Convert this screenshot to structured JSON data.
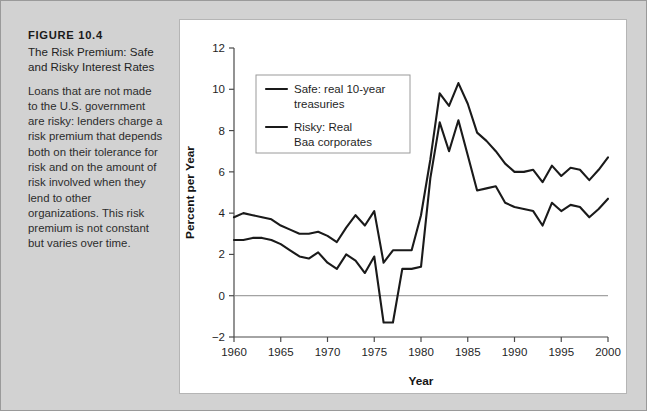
{
  "figure": {
    "label": "FIGURE 10.4",
    "title": "The Risk Premium: Safe and Risky Interest Rates",
    "description": "Loans that are not made to the U.S. government are risky: lenders charge a risk premium that depends both on their tolerance for risk and on the amount of risk involved when they lend to other organizations. This risk premium is not constant but varies over time."
  },
  "colors": {
    "page_background": "#d2d2d2",
    "panel_background": "#ffffff",
    "series_line": "#1a1a1a",
    "axis": "#4a4a4a",
    "zero_line": "#8c8c8c",
    "legend_border": "#9a9a9a"
  },
  "chart_data": {
    "type": "line",
    "title": "",
    "xlabel": "Year",
    "ylabel": "Percent per Year",
    "xlim": [
      1960,
      2000
    ],
    "ylim": [
      -2,
      12
    ],
    "xticks": [
      1960,
      1965,
      1970,
      1975,
      1980,
      1985,
      1990,
      1995,
      2000
    ],
    "yticks": [
      -2,
      0,
      2,
      4,
      6,
      8,
      10,
      12
    ],
    "grid": false,
    "zero_line": true,
    "legend_position": "upper-left-inside",
    "x": [
      1960,
      1961,
      1962,
      1963,
      1964,
      1965,
      1966,
      1967,
      1968,
      1969,
      1970,
      1971,
      1972,
      1973,
      1974,
      1975,
      1976,
      1977,
      1978,
      1979,
      1980,
      1981,
      1982,
      1983,
      1984,
      1985,
      1986,
      1987,
      1988,
      1989,
      1990,
      1991,
      1992,
      1993,
      1994,
      1995,
      1996,
      1997,
      1998,
      1999,
      2000
    ],
    "series": [
      {
        "name": "Risky: Real Baa corporates",
        "legend_label_line1": "Risky: Real",
        "legend_label_line2": "Baa corporates",
        "values": [
          3.8,
          4.0,
          3.9,
          3.8,
          3.7,
          3.4,
          3.2,
          3.0,
          3.0,
          3.1,
          2.9,
          2.6,
          3.3,
          3.9,
          3.4,
          4.1,
          1.6,
          2.2,
          2.2,
          2.2,
          3.9,
          6.6,
          9.8,
          9.2,
          10.3,
          9.3,
          7.9,
          7.5,
          7.0,
          6.4,
          6.0,
          6.0,
          6.1,
          5.5,
          6.3,
          5.8,
          6.2,
          6.1,
          5.6,
          6.1,
          6.7
        ]
      },
      {
        "name": "Safe: real 10-year treasuries",
        "legend_label_line1": "Safe: real 10-year",
        "legend_label_line2": "treasuries",
        "values": [
          2.7,
          2.7,
          2.8,
          2.8,
          2.7,
          2.5,
          2.2,
          1.9,
          1.8,
          2.1,
          1.6,
          1.3,
          2.0,
          1.7,
          1.1,
          1.9,
          -1.3,
          -1.3,
          1.3,
          1.3,
          1.4,
          5.7,
          8.4,
          7.0,
          8.5,
          6.8,
          5.1,
          5.2,
          5.3,
          4.5,
          4.3,
          4.2,
          4.1,
          3.4,
          4.5,
          4.1,
          4.4,
          4.3,
          3.8,
          4.2,
          4.7
        ]
      }
    ]
  },
  "legend": {
    "entries": [
      {
        "line1": "Safe: real 10-year",
        "line2": "treasuries",
        "swatch": "line-swatch-safe"
      },
      {
        "line1": "Risky: Real",
        "line2": "Baa corporates",
        "swatch": "line-swatch-risky"
      }
    ]
  },
  "axis_labels": {
    "x_title": "Year",
    "y_title": "Percent per Year",
    "xticks": [
      "1960",
      "1965",
      "1970",
      "1975",
      "1980",
      "1985",
      "1990",
      "1995",
      "2000"
    ],
    "yticks": [
      "12",
      "10",
      "8",
      "6",
      "4",
      "2",
      "0",
      "−2"
    ]
  }
}
